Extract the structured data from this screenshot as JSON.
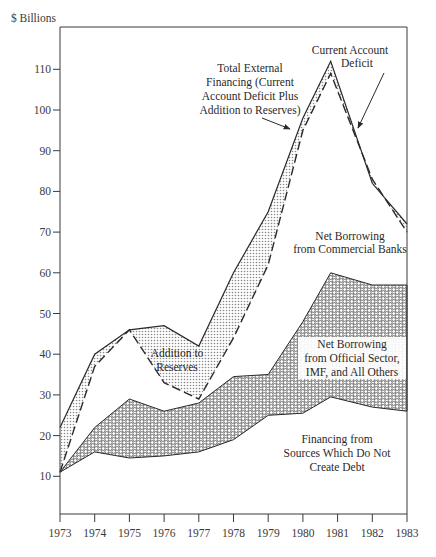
{
  "chart_data": {
    "type": "area",
    "title": "",
    "xlabel": "",
    "ylabel": "$ Billions",
    "xlim": [
      1973,
      1983
    ],
    "ylim": [
      0,
      118
    ],
    "grid": false,
    "x_ticks": [
      "1973",
      "1974",
      "1975",
      "1976",
      "1977",
      "1978",
      "1979",
      "1980",
      "1981",
      "1982",
      "1983"
    ],
    "y_ticks": [
      "10",
      "20",
      "30",
      "40",
      "50",
      "60",
      "70",
      "80",
      "90",
      "100",
      "110"
    ],
    "x": [
      1973,
      1974,
      1975,
      1976,
      1977,
      1978,
      1979,
      1980,
      1980.8,
      1982,
      1983
    ],
    "series": [
      {
        "name": "Total External Financing (Current Account Deficit Plus Addition to Reserves)",
        "style": "solid",
        "values": [
          22,
          40,
          46,
          47,
          42,
          60,
          75,
          98,
          112,
          82,
          72
        ]
      },
      {
        "name": "Current Account Deficit",
        "style": "dashed",
        "values": [
          11,
          37,
          46,
          33,
          29,
          44,
          62,
          95,
          109,
          83,
          70
        ]
      },
      {
        "name": "Net Borrowing from Official Sector, IMF, and All Others (upper boundary)",
        "style": "hex-pattern",
        "values": [
          11,
          22,
          29,
          26,
          28,
          34.5,
          35,
          48,
          60,
          57,
          57
        ]
      },
      {
        "name": "Financing from Sources Which Do Not Create Debt",
        "style": "plain",
        "values": [
          11,
          16,
          14.5,
          15,
          16,
          19,
          25,
          25.5,
          29.5,
          27,
          26
        ]
      }
    ],
    "annotations": [
      {
        "text": "Total External Financing (Current Account Deficit Plus Addition to Reserves)",
        "arrow_to": [
          1979.9,
          97
        ]
      },
      {
        "text": "Current Account Deficit",
        "arrow_to": [
          1981.5,
          93
        ]
      },
      {
        "text": "Addition to Reserves",
        "region": "between solid and dashed, 1975-1977"
      },
      {
        "text": "Net Borrowing from Commercial Banks",
        "region": "between dashed and hex band"
      },
      {
        "text": "Net Borrowing from Official Sector, IMF, and All Others",
        "region": "hex band"
      },
      {
        "text": "Financing from Sources Which Do Not Create Debt",
        "region": "below hex band"
      }
    ]
  },
  "labels": {
    "ylabel": "$ Billions",
    "total_ext_1": "Total External",
    "total_ext_2": "Financing (Current",
    "total_ext_3": "Account Deficit Plus",
    "total_ext_4": "Addition to Reserves)",
    "cad_1": "Current Account",
    "cad_2": "Deficit",
    "reserves_1": "Addition to",
    "reserves_2": "Reserves",
    "banks_1": "Net Borrowing",
    "banks_2": "from Commercial Banks",
    "official_1": "Net Borrowing",
    "official_2": "from Official Sector,",
    "official_3": "IMF, and All Others",
    "nondebt_1": "Financing from",
    "nondebt_2": "Sources Which Do Not",
    "nondebt_3": "Create Debt"
  },
  "colors": {
    "ink": "#2a2a2a",
    "dots": "#9a9a9a",
    "background": "#ffffff"
  }
}
